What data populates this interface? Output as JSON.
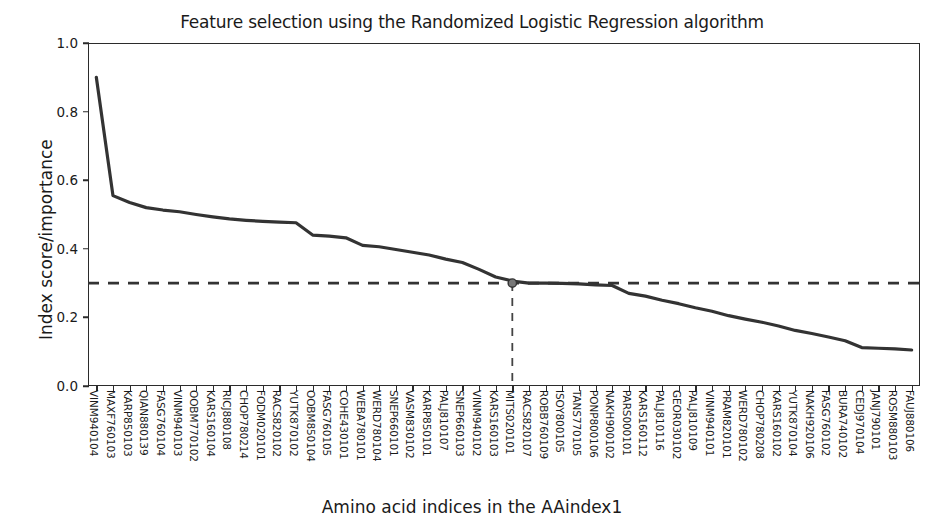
{
  "chart_data": {
    "type": "line",
    "title": "Feature selection using the  Randomized Logistic Regression algorithm",
    "xlabel": "Amino acid indices in the AAindex1",
    "ylabel": "Index score/importance",
    "ylim": [
      0.0,
      1.0
    ],
    "yticks": [
      0.0,
      0.2,
      0.4,
      0.6,
      0.8,
      1.0
    ],
    "ytick_labels": [
      "0.0",
      "0.2",
      "0.4",
      "0.6",
      "0.8",
      "1.0"
    ],
    "grid": false,
    "legend": "none",
    "threshold_line": {
      "value": 0.3,
      "style": "dashed",
      "orientation": "horizontal"
    },
    "cutoff_marker": {
      "category": "RACS820107",
      "index": 25,
      "value": 0.3,
      "vertical_dashed": true
    },
    "categories": [
      "VINM940104",
      "MAXF760103",
      "KARP850103",
      "QIAN880139",
      "FASG760104",
      "VINM940103",
      "OOBM770102",
      "KARS160104",
      "RICJ880108",
      "CHOP780214",
      "FODM020101",
      "RACS820102",
      "YUTK870102",
      "OOBM850104",
      "FASG760105",
      "COHE430101",
      "WEBA780101",
      "WERD780104",
      "SNEP660101",
      "VASM830102",
      "KARP850101",
      "PALJ810107",
      "SNEP660103",
      "VINM940102",
      "KARS160103",
      "MITS020101",
      "RACS820107",
      "ROBB760109",
      "ISOY800105",
      "TANS770105",
      "PONP800106",
      "NAKH900102",
      "PARS000101",
      "KARS160112",
      "PALJ810116",
      "GEOR030102",
      "PALJ810109",
      "VINM940101",
      "PRAM820101",
      "WERD780102",
      "CHOP780208",
      "KARS160102",
      "YUTK870104",
      "NAKH920106",
      "FASG760102",
      "BURA740102",
      "CEDJ970104",
      "JANJ790101",
      "ROSM880103",
      "FAUJ880106"
    ],
    "values": [
      0.9,
      0.555,
      0.535,
      0.52,
      0.513,
      0.508,
      0.5,
      0.493,
      0.487,
      0.483,
      0.48,
      0.478,
      0.476,
      0.44,
      0.437,
      0.432,
      0.41,
      0.406,
      0.398,
      0.39,
      0.382,
      0.37,
      0.36,
      0.34,
      0.318,
      0.306,
      0.3,
      0.3,
      0.299,
      0.298,
      0.295,
      0.293,
      0.27,
      0.262,
      0.25,
      0.24,
      0.228,
      0.218,
      0.205,
      0.195,
      0.186,
      0.175,
      0.162,
      0.153,
      0.143,
      0.132,
      0.112,
      0.11,
      0.108,
      0.105
    ],
    "line_color": "#333333",
    "marker_color": "#555555"
  }
}
